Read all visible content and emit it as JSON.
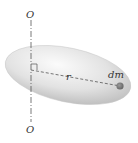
{
  "diagram": {
    "labels": {
      "axis_top": "O",
      "axis_bottom": "O",
      "radius": "r",
      "mass_element": "dm"
    },
    "colors": {
      "body_fill": "#d9d9d9",
      "axis_line": "#555555",
      "mass_dot": "#7a7a7a"
    }
  }
}
